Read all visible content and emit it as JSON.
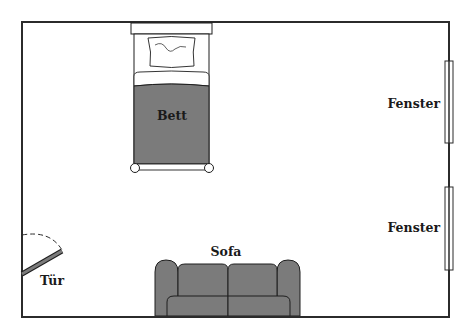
{
  "diagram": {
    "type": "floor-plan",
    "colors": {
      "wall": "#2b2b2b",
      "furniture_fill": "#7b7b7b",
      "furniture_stroke": "#1e1e1e",
      "background": "#ffffff"
    },
    "labels": {
      "bed": "Bett",
      "window_1": "Fenster",
      "window_2": "Fenster",
      "door": "Tür",
      "sofa": "Sofa"
    }
  }
}
